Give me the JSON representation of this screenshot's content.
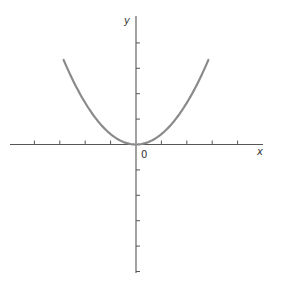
{
  "chart_data": {
    "type": "line",
    "title": "",
    "xlabel": "x",
    "ylabel": "y",
    "origin_label": "0",
    "xlim": [
      -4,
      5
    ],
    "ylim": [
      -5,
      5
    ],
    "x_ticks": [
      -4,
      -3,
      -2,
      -1,
      1,
      2,
      3,
      4
    ],
    "y_ticks": [
      -5,
      -4,
      -3,
      -2,
      -1,
      1,
      2,
      3,
      4
    ],
    "tick_labels_shown": false,
    "grid": false,
    "series": [
      {
        "name": "parabola",
        "equation": "y = a*x^2 (a ≈ 0.41)",
        "x": [
          -2.85,
          -2,
          -1,
          0,
          1,
          2,
          2.85
        ],
        "values": [
          3.35,
          1.64,
          0.41,
          0,
          0.41,
          1.64,
          3.35
        ],
        "color": "#8a8a8a"
      }
    ]
  },
  "colors": {
    "axes": "#555555",
    "curve": "#8a8a8a"
  }
}
